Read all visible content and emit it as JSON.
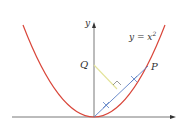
{
  "diagram": {
    "curve_label_lhs": "y = x",
    "curve_label_exp": "2",
    "y_axis_label": "y",
    "point_q_label": "Q",
    "point_p_label": "P",
    "colors": {
      "parabola": "#d9463a",
      "line_op": "#5b7fc4",
      "segment_q": "#e3e39a",
      "axes": "#555555"
    }
  }
}
